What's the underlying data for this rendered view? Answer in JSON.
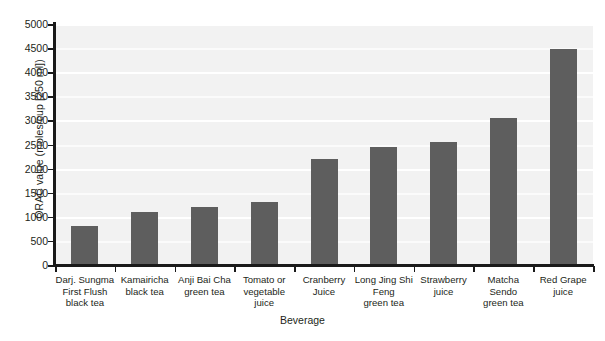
{
  "chart_data": {
    "type": "bar",
    "title": "",
    "xlabel": "Beverage",
    "ylabel": "ORAC value (moles/cup [250 ml])",
    "ylim": [
      0,
      5000
    ],
    "ytick_interval": 500,
    "yticks": [
      0,
      500,
      1000,
      1500,
      2000,
      2500,
      3000,
      3500,
      4000,
      4500,
      5000
    ],
    "ytick_labels": [
      "0",
      "500",
      "1000",
      "1500",
      "2000",
      "2500",
      "3000",
      "3500",
      "4000",
      "4500",
      "5000"
    ],
    "grid": true,
    "grid_axis": "y",
    "legend": false,
    "bar_color": "#5e5e5e",
    "plot_background": "#f2f2f2",
    "categories": [
      [
        "Darj. Sungma",
        "First Flush",
        "black tea"
      ],
      [
        "Kamairicha",
        "black tea"
      ],
      [
        "Anji Bai Cha",
        "green tea"
      ],
      [
        "Tomato or",
        "vegetable",
        "juice"
      ],
      [
        "Cranberry",
        "Juice"
      ],
      [
        "Long Jing Shi",
        "Feng",
        "green tea"
      ],
      [
        "Strawberry",
        "juice"
      ],
      [
        "Matcha",
        "Sendo",
        "green tea"
      ],
      [
        "Red Grape",
        "juice"
      ]
    ],
    "category_names": [
      "Darj. Sungma First Flush black tea",
      "Kamairicha black tea",
      "Anji Bai Cha green tea",
      "Tomato or vegetable juice",
      "Cranberry Juice",
      "Long Jing Shi Feng green tea",
      "Strawberry juice",
      "Matcha Sendo green tea",
      "Red Grape juice"
    ],
    "values": [
      800,
      1100,
      1200,
      1300,
      2200,
      2450,
      2550,
      3050,
      4480
    ]
  }
}
